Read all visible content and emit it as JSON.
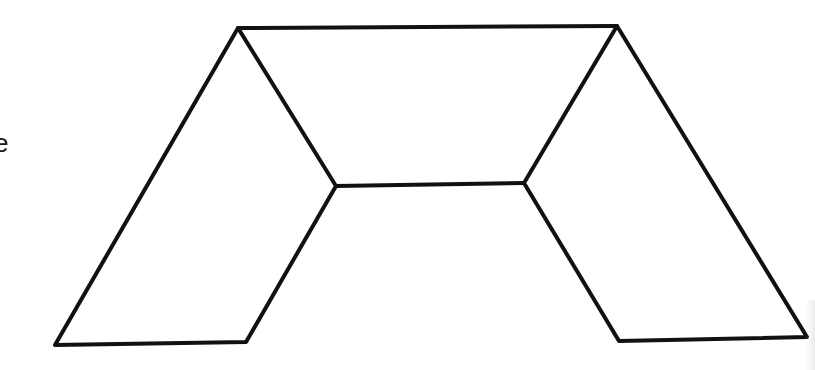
{
  "diagram": {
    "type": "line-drawing",
    "stroke_color": "#111111",
    "background_color": "#ffffff",
    "stroke_width": 4,
    "vertices": {
      "top_left": [
        238,
        28
      ],
      "top_right": [
        617,
        26
      ],
      "inner_left": [
        336,
        186
      ],
      "inner_right": [
        524,
        183
      ],
      "bottom_left_outer": [
        55,
        345
      ],
      "bottom_left_inner": [
        246,
        342
      ],
      "bottom_right_inner": [
        619,
        341
      ],
      "bottom_right_outer": [
        807,
        337
      ]
    },
    "cropped_text_fragment": "e"
  }
}
